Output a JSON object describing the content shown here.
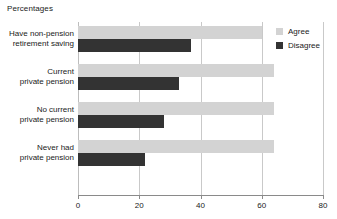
{
  "chart_data": {
    "type": "bar",
    "orientation": "horizontal",
    "title": "Percentages",
    "xlabel": "",
    "ylabel": "",
    "xlim": [
      0,
      80
    ],
    "xticks": [
      0,
      20,
      40,
      60,
      80
    ],
    "xtick_labels": [
      "0",
      "20",
      "40",
      "60",
      "80"
    ],
    "grid": true,
    "legend_position": "top-right",
    "categories": [
      "Have non-pension\nretirement saving",
      "Current\nprivate pension",
      "No current\nprivate pension",
      "Never had\nprivate pension"
    ],
    "series": [
      {
        "name": "Agree",
        "color": "#d3d3d3",
        "values": [
          60,
          64,
          64,
          64
        ]
      },
      {
        "name": "Disagree",
        "color": "#333333",
        "values": [
          37,
          33,
          28,
          22
        ]
      }
    ]
  },
  "colors": {
    "agree": "#d3d3d3",
    "disagree": "#333333",
    "gridline": "#c9c9c9",
    "axis": "#8a8a8a",
    "text": "#1a1a1a",
    "background": "#ffffff"
  }
}
